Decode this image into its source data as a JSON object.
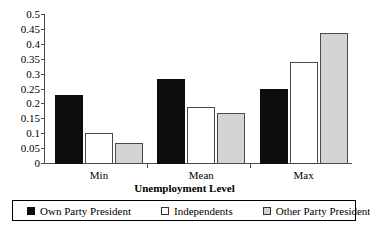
{
  "chart_data": {
    "type": "bar",
    "title": "",
    "xlabel": "Unemployment Level",
    "ylabel": "",
    "categories": [
      "Min",
      "Mean",
      "Max"
    ],
    "series": [
      {
        "name": "Own Party President",
        "values": [
          0.23,
          0.285,
          0.252
        ],
        "color": "#0d0d0d"
      },
      {
        "name": "Independents",
        "values": [
          0.103,
          0.19,
          0.343
        ],
        "color": "#ffffff"
      },
      {
        "name": "Other Party President",
        "values": [
          0.07,
          0.172,
          0.44
        ],
        "color": "#d4d4d4"
      }
    ],
    "ylim": [
      0,
      0.5
    ],
    "yticks": [
      "0",
      "0.05",
      "0.1",
      "0.15",
      "0.2",
      "0.25",
      "0.3",
      "0.35",
      "0.4",
      "0.45",
      "0.5"
    ],
    "ytick_values": [
      0,
      0.05,
      0.1,
      0.15,
      0.2,
      0.25,
      0.3,
      0.35,
      0.4,
      0.45,
      0.5
    ],
    "grid": false,
    "legend_position": "bottom"
  },
  "legend": {
    "items": [
      {
        "label": "Own Party President",
        "swatch": "black-square-icon"
      },
      {
        "label": "Independents",
        "swatch": "white-square-icon"
      },
      {
        "label": "Other Party President",
        "swatch": "gray-square-icon"
      }
    ]
  }
}
